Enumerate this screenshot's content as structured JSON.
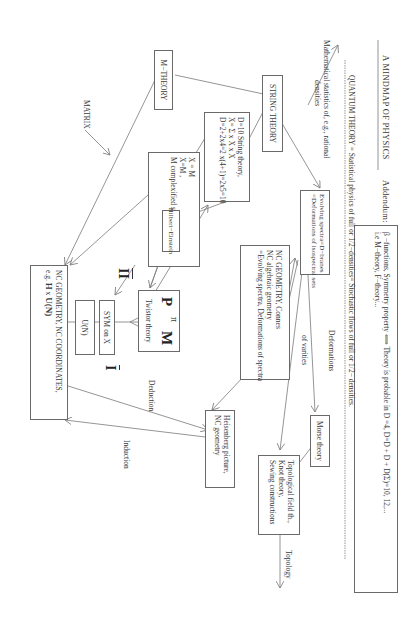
{
  "header": {
    "title": "A  MINDMAP OF PHYSICS",
    "addendum_label": "Addendum:"
  },
  "addendum": {
    "line1": "β −functions, Symmetry property ⟺  Theory is probable in D  =4, D=D  + D   + D(Σ)=10, 12,...",
    "line2": "i.e M−theory, F−theory..."
  },
  "quantum": {
    "label": "QUANTUM THEORY",
    "text": " = Statistical physics of full or 1/2−densities= Stochastic flows of full or 1/2− densities."
  },
  "math_statistics": {
    "line1": "Mathematical statistics of, e.g., rational",
    "line2": "densities"
  },
  "nodes": {
    "string_theory": "STRING THEORY",
    "m_theory": "M−THEORY",
    "d10": {
      "line1": "D=10  String theory,",
      "line2": "X= Σ  x  X  x  X",
      "line3": "D=2+2x4=2 x(4+1)=2x5=10"
    },
    "x_box": {
      "line1": "X  = M",
      "line2": "X=M  ,",
      "line3": "M    complexified space−time"
    },
    "hilbert_einstein": "Hilbert−Einstein",
    "evolving_spectra": {
      "line1": "Evolving spectra=D−branes",
      "line2": "=Deformations of isospectral sets"
    },
    "nc_connes": {
      "line1": "NC  GEOMETRY, Connes",
      "line2": "NC   algebraic geometry",
      "line3": "=Evolving spectra, Deformations of spectra"
    },
    "twistor": {
      "p": "P",
      "pi": "π",
      "m": "M",
      "label": "Twistor theory"
    },
    "sym_on_x": "SYM on X",
    "u_n": "U(N)",
    "nc_big": {
      "line1": "NC GEOMETRY, NC COORDINATES,",
      "line2_prefix": "e.g.",
      "line2_h": "H",
      "line2_x": "x",
      "line2_u": "U(N)"
    },
    "heisenberg": {
      "line1": "Heisenberg picture,",
      "line2": "NC  geometry"
    },
    "morse": "Morse theory",
    "topological": {
      "line1": "Topological field th.,",
      "line2": "Knot theory,",
      "line3": "Sewing constructions"
    }
  },
  "labels": {
    "matrix": "MATRIX",
    "geometry": "Geometry",
    "deduction": "Deduction",
    "induction": "Induction",
    "deformations": "Deformations",
    "of_varities": "of varities",
    "topology": "Topology",
    "roman_I": "I",
    "roman_II": "II",
    "roman_III": "III"
  }
}
